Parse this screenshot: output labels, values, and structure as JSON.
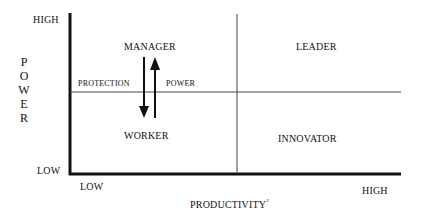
{
  "diagram": {
    "y_axis": {
      "title_letters": [
        "P",
        "O",
        "W",
        "E",
        "R"
      ],
      "high_label": "HIGH",
      "low_label": "LOW"
    },
    "x_axis": {
      "title": "PRODUCTIVITY",
      "title_superscript": "2",
      "low_label": "LOW",
      "high_label": "HIGH"
    },
    "quadrants": {
      "top_left": "MANAGER",
      "top_right": "LEADER",
      "bottom_left": "WORKER",
      "bottom_right": "INNOVATOR"
    },
    "arrows": {
      "down_label": "PROTECTION",
      "up_label": "POWER"
    },
    "colors": {
      "ink": "#111111",
      "background": "#ffffff"
    }
  }
}
